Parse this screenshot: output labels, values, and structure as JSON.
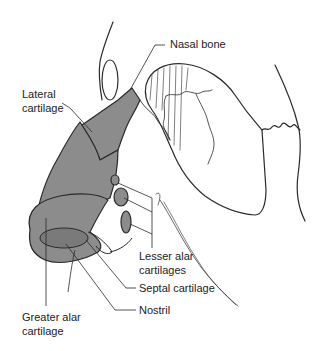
{
  "diagram": {
    "type": "anatomical-illustration",
    "colors": {
      "cartilage_fill": "#8c8c8c",
      "line": "#2a2a2a",
      "background": "#ffffff"
    },
    "labels": {
      "nasal_bone": "Nasal bone",
      "lateral_cartilage_1": "Lateral",
      "lateral_cartilage_2": "cartilage",
      "lesser_alar_1": "Lesser alar",
      "lesser_alar_2": "cartilages",
      "septal_cartilage": "Septal cartilage",
      "nostril": "Nostril",
      "greater_alar_1": "Greater alar",
      "greater_alar_2": "cartilage"
    }
  }
}
